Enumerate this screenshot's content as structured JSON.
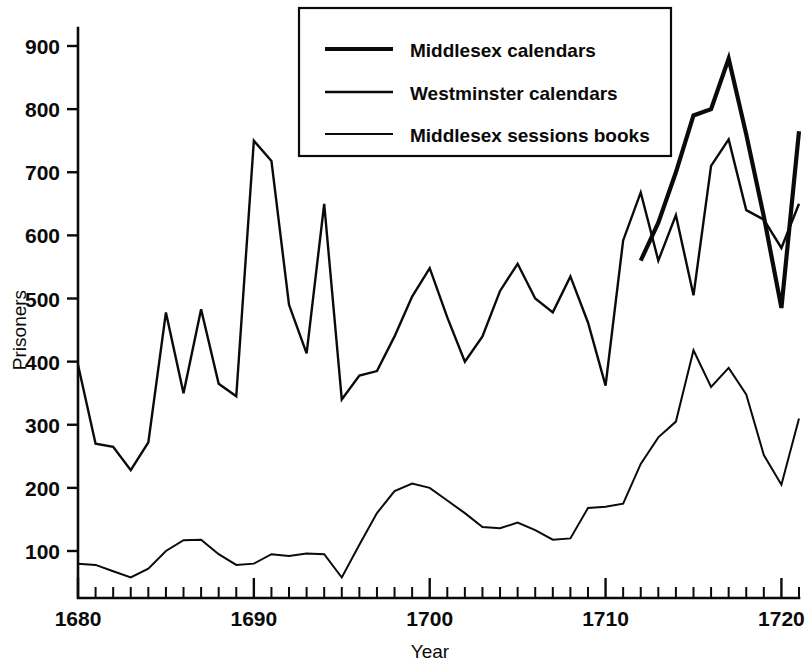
{
  "chart_data": {
    "type": "line",
    "title": "",
    "xlabel": "Year",
    "ylabel": "Prisoners",
    "xlim": [
      1680,
      1721
    ],
    "ylim": [
      0,
      900
    ],
    "grid": false,
    "legend_position": "top-center",
    "y_ticks": [
      100,
      200,
      300,
      400,
      500,
      600,
      700,
      800,
      900
    ],
    "y_tick_labels": [
      "100",
      "200",
      "300",
      "400",
      "500",
      "600",
      "700",
      "800",
      "900"
    ],
    "x_ticks": [
      1680,
      1690,
      1700,
      1710,
      1720
    ],
    "x_tick_labels": [
      "1680",
      "1690",
      "1700",
      "1710",
      "1720"
    ],
    "x_minor_tick_step": 1,
    "series": [
      {
        "name": "Middlesex calendars",
        "line_width": 4.2,
        "x": [
          1712,
          1713,
          1714,
          1715,
          1716,
          1717,
          1718,
          1719,
          1720,
          1721
        ],
        "values": [
          560,
          620,
          700,
          790,
          800,
          880,
          760,
          630,
          485,
          765
        ]
      },
      {
        "name": "Westminster calendars",
        "line_width": 2.4,
        "x": [
          1680,
          1681,
          1682,
          1683,
          1684,
          1685,
          1686,
          1687,
          1688,
          1689,
          1690,
          1691,
          1692,
          1693,
          1694,
          1695,
          1696,
          1697,
          1698,
          1699,
          1700,
          1701,
          1702,
          1703,
          1704,
          1705,
          1706,
          1707,
          1708,
          1709,
          1710,
          1711,
          1712,
          1713,
          1714,
          1715,
          1716,
          1717,
          1718,
          1719,
          1720,
          1721
        ],
        "values": [
          395,
          270,
          265,
          228,
          272,
          478,
          350,
          483,
          365,
          345,
          750,
          718,
          490,
          413,
          650,
          340,
          378,
          385,
          440,
          503,
          548,
          470,
          400,
          440,
          512,
          555,
          500,
          478,
          535,
          462,
          362,
          592,
          668,
          560,
          632,
          505,
          710,
          752,
          640,
          625,
          580,
          650
        ]
      },
      {
        "name": "Middlesex sessions books",
        "line_width": 2.0,
        "x": [
          1680,
          1681,
          1682,
          1683,
          1684,
          1685,
          1686,
          1687,
          1688,
          1689,
          1690,
          1691,
          1692,
          1693,
          1694,
          1695,
          1696,
          1697,
          1698,
          1699,
          1700,
          1701,
          1702,
          1703,
          1704,
          1705,
          1706,
          1707,
          1708,
          1709,
          1710,
          1711,
          1712,
          1713,
          1714,
          1715,
          1716,
          1717,
          1718,
          1719,
          1720,
          1721
        ],
        "values": [
          80,
          78,
          68,
          58,
          72,
          100,
          117,
          118,
          95,
          78,
          80,
          95,
          92,
          96,
          95,
          58,
          110,
          160,
          195,
          207,
          200,
          180,
          160,
          138,
          136,
          145,
          133,
          118,
          120,
          168,
          170,
          175,
          238,
          280,
          305,
          418,
          360,
          390,
          348,
          252,
          205,
          310
        ]
      }
    ]
  },
  "legend": {
    "entries": [
      {
        "label": "Middlesex calendars"
      },
      {
        "label": "Westminster calendars"
      },
      {
        "label": "Middlesex sessions books"
      }
    ]
  }
}
